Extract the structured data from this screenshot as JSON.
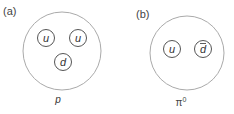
{
  "panels": [
    {
      "label": "(a)",
      "particle": "p",
      "quarks": [
        {
          "symbol": "u",
          "anti": false
        },
        {
          "symbol": "u",
          "anti": false
        },
        {
          "symbol": "d",
          "anti": false
        }
      ]
    },
    {
      "label": "(b)",
      "particle": "π",
      "particle_sup": "0",
      "quarks": [
        {
          "symbol": "u",
          "anti": false
        },
        {
          "symbol": "d",
          "anti": true
        }
      ]
    }
  ],
  "colors": {
    "outer": "#aaaaaa",
    "quark": "#555555",
    "text": "#444444"
  }
}
